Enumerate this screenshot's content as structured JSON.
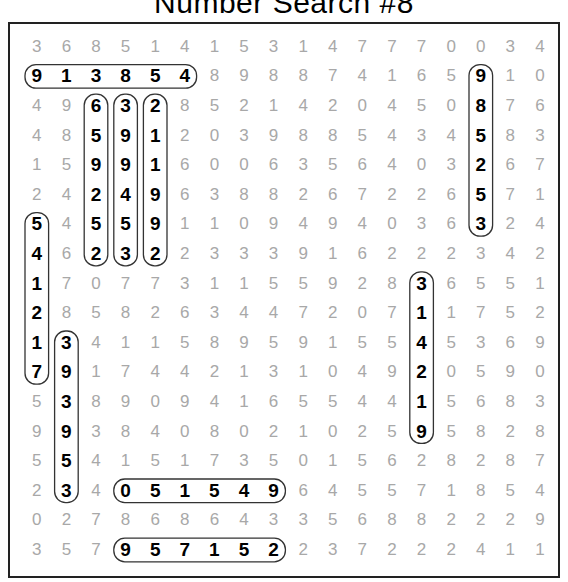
{
  "title": "Number Search #8",
  "grid": [
    [
      "3",
      "6",
      "8",
      "5",
      "1",
      "4",
      "1",
      "5",
      "3",
      "1",
      "4",
      "7",
      "7",
      "7",
      "0",
      "0",
      "3",
      "4"
    ],
    [
      "9",
      "1",
      "3",
      "8",
      "5",
      "4",
      "8",
      "9",
      "8",
      "8",
      "7",
      "4",
      "1",
      "6",
      "5",
      "9",
      "1",
      "0"
    ],
    [
      "4",
      "9",
      "6",
      "3",
      "2",
      "8",
      "5",
      "2",
      "1",
      "4",
      "2",
      "0",
      "4",
      "5",
      "0",
      "8",
      "7",
      "6"
    ],
    [
      "4",
      "8",
      "5",
      "9",
      "1",
      "2",
      "0",
      "3",
      "9",
      "8",
      "8",
      "5",
      "4",
      "3",
      "4",
      "5",
      "8",
      "3"
    ],
    [
      "1",
      "5",
      "9",
      "9",
      "1",
      "6",
      "0",
      "0",
      "6",
      "3",
      "5",
      "6",
      "4",
      "0",
      "3",
      "2",
      "6",
      "7"
    ],
    [
      "2",
      "4",
      "2",
      "4",
      "9",
      "6",
      "3",
      "8",
      "8",
      "2",
      "6",
      "7",
      "2",
      "2",
      "6",
      "5",
      "7",
      "1"
    ],
    [
      "5",
      "4",
      "5",
      "5",
      "9",
      "1",
      "1",
      "0",
      "9",
      "4",
      "9",
      "4",
      "0",
      "3",
      "6",
      "3",
      "2",
      "4"
    ],
    [
      "4",
      "6",
      "2",
      "3",
      "2",
      "2",
      "3",
      "3",
      "3",
      "9",
      "1",
      "6",
      "2",
      "2",
      "2",
      "3",
      "4",
      "2"
    ],
    [
      "1",
      "7",
      "0",
      "7",
      "7",
      "3",
      "1",
      "1",
      "5",
      "5",
      "9",
      "2",
      "8",
      "3",
      "6",
      "5",
      "5",
      "1"
    ],
    [
      "2",
      "8",
      "5",
      "8",
      "2",
      "6",
      "3",
      "4",
      "4",
      "7",
      "2",
      "0",
      "7",
      "1",
      "1",
      "7",
      "5",
      "2"
    ],
    [
      "1",
      "3",
      "4",
      "1",
      "1",
      "5",
      "8",
      "9",
      "5",
      "9",
      "1",
      "5",
      "5",
      "4",
      "5",
      "3",
      "6",
      "9"
    ],
    [
      "7",
      "9",
      "1",
      "7",
      "4",
      "4",
      "2",
      "1",
      "3",
      "1",
      "0",
      "4",
      "9",
      "2",
      "0",
      "5",
      "9",
      "0"
    ],
    [
      "5",
      "3",
      "8",
      "9",
      "0",
      "9",
      "4",
      "1",
      "6",
      "5",
      "5",
      "4",
      "4",
      "1",
      "5",
      "6",
      "8",
      "3"
    ],
    [
      "9",
      "9",
      "3",
      "8",
      "4",
      "0",
      "8",
      "0",
      "2",
      "1",
      "0",
      "2",
      "5",
      "9",
      "5",
      "8",
      "2",
      "8"
    ],
    [
      "5",
      "5",
      "4",
      "1",
      "5",
      "1",
      "7",
      "3",
      "5",
      "0",
      "1",
      "5",
      "6",
      "2",
      "8",
      "2",
      "8",
      "7"
    ],
    [
      "2",
      "3",
      "4",
      "0",
      "5",
      "1",
      "5",
      "4",
      "9",
      "6",
      "4",
      "5",
      "5",
      "7",
      "1",
      "8",
      "5",
      "4"
    ],
    [
      "0",
      "2",
      "7",
      "8",
      "6",
      "8",
      "6",
      "4",
      "3",
      "3",
      "5",
      "6",
      "8",
      "8",
      "2",
      "2",
      "2",
      "9"
    ],
    [
      "3",
      "5",
      "7",
      "9",
      "5",
      "7",
      "1",
      "5",
      "2",
      "2",
      "3",
      "7",
      "2",
      "2",
      "2",
      "4",
      "1",
      "1"
    ]
  ],
  "found_numbers": [
    {
      "value": "913854",
      "start": [
        1,
        0
      ],
      "end": [
        1,
        5
      ],
      "direction": "horizontal"
    },
    {
      "value": "659252",
      "start": [
        2,
        2
      ],
      "end": [
        7,
        2
      ],
      "direction": "vertical"
    },
    {
      "value": "399453",
      "start": [
        2,
        3
      ],
      "end": [
        7,
        3
      ],
      "direction": "vertical"
    },
    {
      "value": "211992",
      "start": [
        2,
        4
      ],
      "end": [
        7,
        4
      ],
      "direction": "vertical"
    },
    {
      "value": "985253",
      "start": [
        1,
        15
      ],
      "end": [
        6,
        15
      ],
      "direction": "vertical"
    },
    {
      "value": "541217",
      "start": [
        6,
        0
      ],
      "end": [
        11,
        0
      ],
      "direction": "vertical"
    },
    {
      "value": "393953",
      "start": [
        10,
        1
      ],
      "end": [
        15,
        1
      ],
      "direction": "vertical"
    },
    {
      "value": "051549",
      "start": [
        15,
        3
      ],
      "end": [
        15,
        8
      ],
      "direction": "horizontal"
    },
    {
      "value": "957152",
      "start": [
        17,
        3
      ],
      "end": [
        17,
        8
      ],
      "direction": "horizontal"
    },
    {
      "value": "314219",
      "start": [
        8,
        13
      ],
      "end": [
        13,
        13
      ],
      "direction": "vertical"
    }
  ]
}
